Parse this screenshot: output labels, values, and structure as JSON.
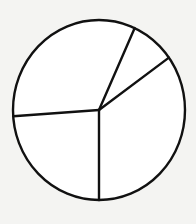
{
  "chart_data": {
    "type": "pie",
    "title": "",
    "labels": [
      "",
      "",
      "",
      ""
    ],
    "values": [
      8.3,
      34.9,
      23.9,
      32.9
    ],
    "start_angle_deg": 24.5,
    "direction": "clockwise",
    "legend": "none",
    "colors": {
      "stroke": "#111111",
      "fill": "#ffffff",
      "background": "#f4f4f2"
    }
  }
}
